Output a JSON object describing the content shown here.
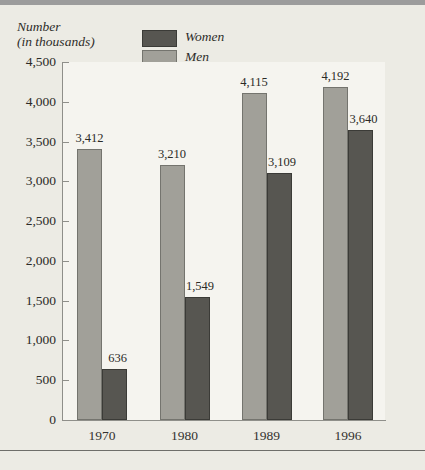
{
  "page": {
    "background_color": "#ecebe4",
    "plot_background_color": "#f5f4ef",
    "top_band_color": "#9c9c9c",
    "bottom_rule_color": "#6e6e6a",
    "axis_color": "#8f8f8a",
    "text_color": "#2b2a27"
  },
  "chart_data": {
    "type": "bar",
    "title": "",
    "ylabel": "Number (in thousands)",
    "ylabel_lines": [
      "Number",
      "(in thousands)"
    ],
    "xlabel": "",
    "categories": [
      "1970",
      "1980",
      "1989",
      "1996"
    ],
    "series": [
      {
        "name": "Men",
        "color": "#a1a099",
        "border_color": "#74746e",
        "values": [
          3412,
          3210,
          4115,
          4192
        ]
      },
      {
        "name": "Women",
        "color": "#575651",
        "border_color": "#3b3b37",
        "values": [
          636,
          1549,
          3109,
          3640
        ]
      }
    ],
    "legend_order": [
      "Women",
      "Men"
    ],
    "ylim": [
      0,
      4500
    ],
    "ytick_step": 500,
    "grid": false,
    "legend_position": "top-center",
    "bar_value_labels": true
  }
}
